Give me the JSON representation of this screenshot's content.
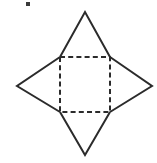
{
  "figure": {
    "canvas": {
      "width": 157,
      "height": 163,
      "background": "#ffffff"
    },
    "style": {
      "solid_stroke_color": "#2b2b2b",
      "dashed_stroke_color": "#2b2b2b",
      "stroke_width": 2,
      "dash_pattern": "5 3.2",
      "face_fill": "#ffffff"
    },
    "square": {
      "name": "central-square",
      "line_style": "dashed",
      "corners": {
        "top_left": {
          "x": 60,
          "y": 57
        },
        "top_right": {
          "x": 110,
          "y": 57
        },
        "bottom_right": {
          "x": 110,
          "y": 112
        },
        "bottom_left": {
          "x": 60,
          "y": 112
        }
      },
      "points": "60,57 110,57 110,112 60,112"
    },
    "triangles": [
      {
        "name": "top-triangle",
        "line_style": "solid",
        "apex": {
          "x": 85,
          "y": 12
        },
        "base_start": {
          "x": 60,
          "y": 57
        },
        "base_end": {
          "x": 110,
          "y": 57
        },
        "points": "60,57 85,12 110,57"
      },
      {
        "name": "left-triangle",
        "line_style": "solid",
        "apex": {
          "x": 17,
          "y": 86
        },
        "base_start": {
          "x": 60,
          "y": 57
        },
        "base_end": {
          "x": 60,
          "y": 112
        },
        "points": "60,57 17,86 60,112"
      },
      {
        "name": "right-triangle",
        "line_style": "solid",
        "apex": {
          "x": 152,
          "y": 86
        },
        "base_start": {
          "x": 110,
          "y": 57
        },
        "base_end": {
          "x": 110,
          "y": 112
        },
        "points": "110,57 152,86 110,112"
      },
      {
        "name": "bottom-triangle",
        "line_style": "solid",
        "apex": {
          "x": 85,
          "y": 155
        },
        "base_start": {
          "x": 60,
          "y": 112
        },
        "base_end": {
          "x": 110,
          "y": 112
        },
        "points": "60,112 85,155 110,112"
      }
    ],
    "artifact": {
      "name": "scan-speck",
      "x": 26,
      "y": 2,
      "width": 4,
      "height": 4,
      "color": "#3a3a3a"
    }
  }
}
